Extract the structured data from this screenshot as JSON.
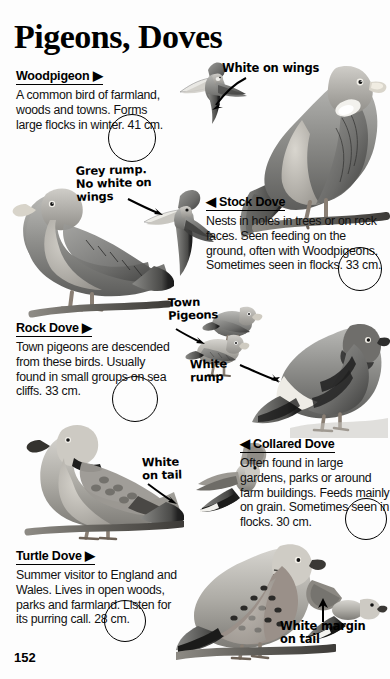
{
  "page": {
    "title": "Pigeons, Doves",
    "number": "152",
    "background_color": "#fdfdfd",
    "ink_color": "#111111"
  },
  "species": [
    {
      "name": "Woodpigeon",
      "marker": "right",
      "heading": "Woodpigeon ▶",
      "description": "A common bird of farmland, woods and towns. Forms large flocks in winter. 41 cm.",
      "size": "41 cm."
    },
    {
      "name": "Stock Dove",
      "marker": "left",
      "heading": "◀ Stock Dove",
      "description": "Nests in holes in trees or on rock faces. Seen feeding on the ground, often with Woodpigeons. Sometimes seen in flocks. 33 cm.",
      "size": "33 cm."
    },
    {
      "name": "Rock Dove",
      "marker": "right",
      "heading": "Rock Dove ▶",
      "description": "Town pigeons are descended from these birds. Usually found in small groups on sea cliffs. 33 cm.",
      "size": "33 cm."
    },
    {
      "name": "Collared Dove",
      "marker": "left",
      "heading": "◀ Collared Dove",
      "description": "Often found in large gardens, parks or around farm buildings. Feeds mainly on grain. Sometimes seen in flocks. 30 cm.",
      "size": "30 cm."
    },
    {
      "name": "Turtle Dove",
      "marker": "right",
      "heading": "Turtle Dove ▶",
      "description": "Summer visitor to England and Wales. Lives in open woods, parks and farmland. Listen for its purring call. 28 cm.",
      "size": "28 cm."
    }
  ],
  "annotations": [
    {
      "id": "white-on-wings",
      "text": "White on wings"
    },
    {
      "id": "grey-rump",
      "text": "Grey rump.\nNo white on\nwings"
    },
    {
      "id": "town-pigeons",
      "text": "Town\nPigeons"
    },
    {
      "id": "white-rump",
      "text": "White\nrump"
    },
    {
      "id": "white-on-tail",
      "text": "White\non tail"
    },
    {
      "id": "white-margin",
      "text": "White margin\non tail"
    }
  ],
  "illustrations": [
    {
      "id": "woodpigeon-flight",
      "label": "Woodpigeon in flight"
    },
    {
      "id": "woodpigeon-perched",
      "label": "Woodpigeon perched"
    },
    {
      "id": "stock-dove-perched",
      "label": "Stock Dove perched"
    },
    {
      "id": "stock-dove-flight",
      "label": "Stock Dove in flight"
    },
    {
      "id": "town-pigeon-a",
      "label": "Town pigeon standing"
    },
    {
      "id": "town-pigeon-b",
      "label": "Town pigeon standing"
    },
    {
      "id": "rock-dove-perched",
      "label": "Rock Dove perched"
    },
    {
      "id": "collared-dove-perched",
      "label": "Collared Dove perched"
    },
    {
      "id": "collared-dove-flight",
      "label": "Collared Dove in flight"
    },
    {
      "id": "turtle-dove-perched",
      "label": "Turtle Dove perched"
    },
    {
      "id": "turtle-dove-flight",
      "label": "Turtle Dove in flight"
    }
  ]
}
